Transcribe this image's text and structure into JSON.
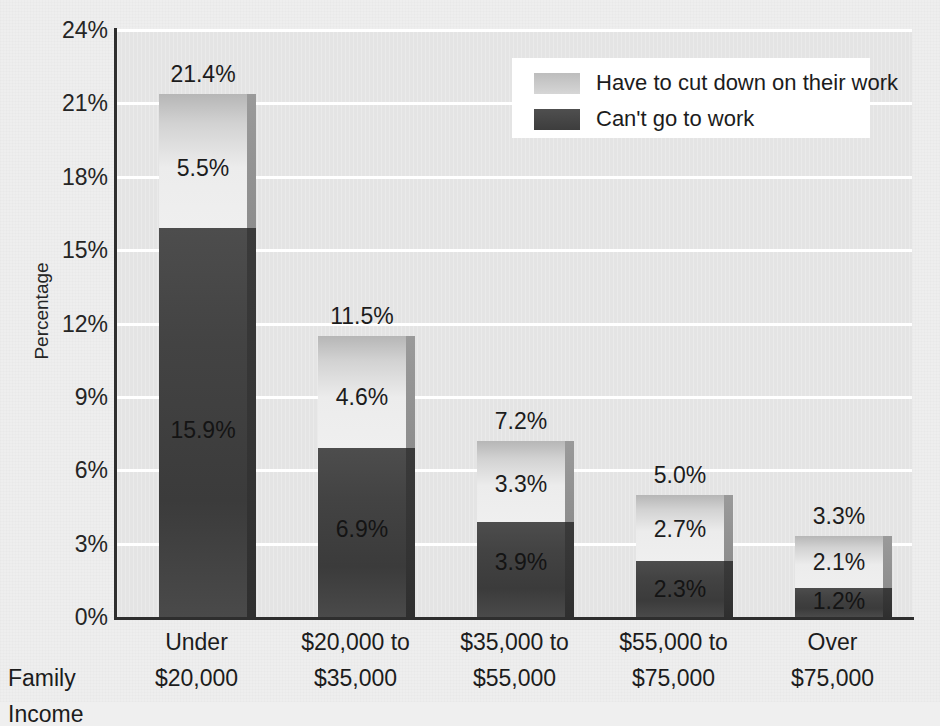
{
  "chart_data": {
    "type": "bar",
    "subtype": "stacked-bar",
    "title": "",
    "xlabel": "Family Income",
    "ylabel": "Percentage",
    "ylim": [
      0,
      24
    ],
    "ytick_labels": [
      "0%",
      "3%",
      "6%",
      "9%",
      "12%",
      "15%",
      "18%",
      "21%",
      "24%"
    ],
    "ytick_values": [
      0,
      3,
      6,
      9,
      12,
      15,
      18,
      21,
      24
    ],
    "grid": true,
    "legend_position": "top-right",
    "categories": [
      "Under\n$20,000",
      "$20,000 to\n$35,000",
      "$35,000 to\n$55,000",
      "$55,000 to\n$75,000",
      "Over\n$75,000"
    ],
    "category_lines": [
      [
        "Under",
        "$20,000"
      ],
      [
        "$20,000 to",
        "$35,000"
      ],
      [
        "$35,000 to",
        "$55,000"
      ],
      [
        "$55,000 to",
        "$75,000"
      ],
      [
        "Over",
        "$75,000"
      ]
    ],
    "series": [
      {
        "name": "Can't go to work",
        "color": "#434343",
        "values": [
          15.9,
          6.9,
          3.9,
          2.3,
          1.2
        ],
        "labels": [
          "15.9%",
          "6.9%",
          "3.9%",
          "2.3%",
          "1.2%"
        ]
      },
      {
        "name": "Have to cut down on their work",
        "color": "#d2d2d2",
        "values": [
          5.5,
          4.6,
          3.3,
          2.7,
          2.1
        ],
        "labels": [
          "5.5%",
          "4.6%",
          "3.3%",
          "2.7%",
          "2.1%"
        ]
      }
    ],
    "totals": [
      21.4,
      11.5,
      7.2,
      5.0,
      3.3
    ],
    "total_labels": [
      "21.4%",
      "11.5%",
      "7.2%",
      "5.0%",
      "3.3%"
    ]
  },
  "legend": {
    "items": [
      {
        "label": "Have to cut down on their work",
        "swatch": "light"
      },
      {
        "label": "Can't go to work",
        "swatch": "dark"
      }
    ]
  },
  "axis": {
    "y_title": "Percentage",
    "x_title": "Family Income"
  },
  "colors": {
    "plot_background": "#e4e4e4",
    "page_background": "#eeeeee",
    "gridline": "#ffffff",
    "axis": "#2e2e2e",
    "light_series": "#d2d2d2",
    "dark_series": "#434343",
    "text": "#1c1c1c",
    "legend_background": "#ffffff"
  }
}
